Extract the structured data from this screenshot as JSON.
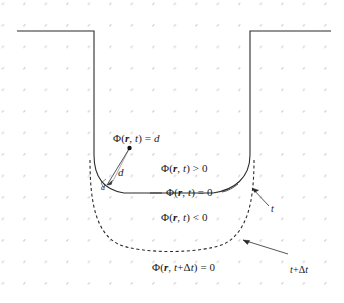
{
  "figure": {
    "background_color": "#ffffff",
    "grid": {
      "dot_color": "#c8c8c8",
      "dot_radius": 2,
      "spacing_x": 21.5,
      "spacing_y": 21.5,
      "origin_x": 23,
      "origin_y": 24,
      "columns": 15,
      "rows": 13
    },
    "curves": {
      "interface_t": {
        "style": "solid",
        "color": "#222222",
        "width": 1.1,
        "label": "interface at time t"
      },
      "interface_t_plus_dt": {
        "style": "dashed",
        "color": "#222222",
        "width": 1.1,
        "label": "interface at time t+Δt"
      }
    }
  },
  "labels": {
    "phi_equals_d": {
      "prefix": "Φ(",
      "vec": "r",
      "comma": ", ",
      "time": "t",
      "suffix": ") = ",
      "value": "d"
    },
    "phi_positive": {
      "prefix": "Φ(",
      "vec": "r",
      "comma": ", ",
      "time": "t",
      "suffix": ") > 0"
    },
    "phi_zero": {
      "prefix": "Φ(",
      "vec": "r",
      "comma": ", ",
      "time": "t",
      "suffix": ") = 0"
    },
    "phi_negative": {
      "prefix": "Φ(",
      "vec": "r",
      "comma": ", ",
      "time": "t",
      "suffix": ") < 0"
    },
    "phi_next_zero": {
      "prefix": "Φ(",
      "vec": "r",
      "comma": ", ",
      "time": "t",
      "plus": "+Δ",
      "time2": "t",
      "suffix": ") = 0"
    },
    "distance_major": "d",
    "distance_minor": "d",
    "time_t": "t",
    "time_t_plus_dt": {
      "time": "t",
      "plus": "+Δ",
      "time2": "t"
    }
  }
}
